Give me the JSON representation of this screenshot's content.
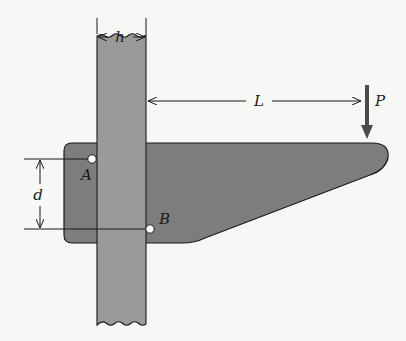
{
  "figure": {
    "type": "engineering-mechanics-diagram",
    "labels": {
      "column_width": "h",
      "bolt_spacing": "d",
      "load_distance": "L",
      "load": "P",
      "bolt_upper": "A",
      "bolt_lower": "B"
    },
    "colors": {
      "background": "#f7f7f5",
      "bracket_fill": "#7d7d7d",
      "column_fill": "#9a9a9a",
      "line": "#1a1a1a",
      "bolt_fill": "#ffffff"
    }
  }
}
